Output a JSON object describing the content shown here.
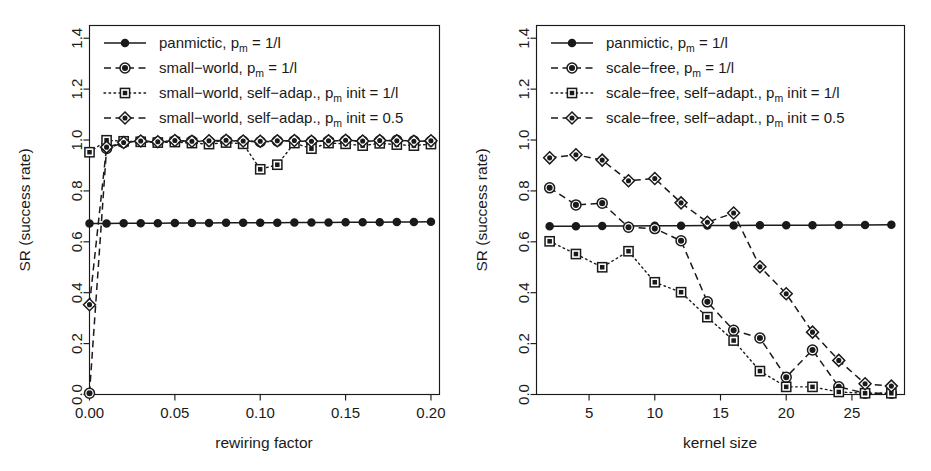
{
  "figure": {
    "panels": [
      "left",
      "right"
    ],
    "background": "#ffffff",
    "ink": "#1a1a1a"
  },
  "chart_data": [
    {
      "panel": "left",
      "type": "line",
      "title": "",
      "xlabel": "rewiring factor",
      "ylabel": "SR (success rate)",
      "xlim": [
        0.0,
        0.205
      ],
      "ylim": [
        0.0,
        1.45
      ],
      "xticks": [
        0.0,
        0.05,
        0.1,
        0.15,
        0.2
      ],
      "xtick_labels": [
        "0.00",
        "0.05",
        "0.10",
        "0.15",
        "0.20"
      ],
      "yticks": [
        0.0,
        0.2,
        0.4,
        0.6,
        0.8,
        1.0,
        1.2,
        1.4
      ],
      "ytick_labels": [
        "0.0",
        "0.2",
        "0.4",
        "0.6",
        "0.8",
        "1.0",
        "1.2",
        "1.4"
      ],
      "grid": false,
      "legend_position": "top-left",
      "x": [
        0.0,
        0.01,
        0.02,
        0.03,
        0.04,
        0.05,
        0.06,
        0.07,
        0.08,
        0.09,
        0.1,
        0.11,
        0.12,
        0.13,
        0.14,
        0.15,
        0.16,
        0.17,
        0.18,
        0.19,
        0.2
      ],
      "series": [
        {
          "name": "panmictic, pm = 1/l",
          "marker": "filled-circle",
          "line": "solid",
          "values": [
            0.672,
            0.672,
            0.673,
            0.673,
            0.673,
            0.674,
            0.674,
            0.674,
            0.675,
            0.675,
            0.675,
            0.675,
            0.676,
            0.676,
            0.676,
            0.677,
            0.677,
            0.677,
            0.678,
            0.678,
            0.679
          ]
        },
        {
          "name": "small-world, pm = 1/l",
          "marker": "dotted-circle",
          "line": "dashed",
          "values": [
            0.005,
            0.967,
            0.99,
            0.995,
            0.992,
            0.997,
            0.996,
            0.993,
            0.998,
            0.995,
            0.993,
            0.996,
            0.997,
            0.994,
            0.996,
            0.998,
            0.995,
            0.997,
            0.999,
            0.996,
            0.995
          ]
        },
        {
          "name": "small-world, self-adap., pm init = 1/l",
          "marker": "open-square",
          "line": "dotted",
          "values": [
            0.952,
            0.999,
            0.995,
            0.993,
            0.99,
            0.992,
            0.988,
            0.984,
            0.99,
            0.985,
            0.885,
            0.903,
            0.988,
            0.966,
            0.988,
            0.985,
            0.978,
            0.987,
            0.982,
            0.978,
            0.984
          ]
        },
        {
          "name": "small-world, self-adap., pm init = 0.5",
          "marker": "open-diamond",
          "line": "dashdot",
          "values": [
            0.353,
            0.972,
            0.99,
            0.996,
            0.993,
            0.998,
            0.995,
            0.997,
            0.999,
            0.996,
            0.995,
            0.997,
            0.998,
            0.995,
            0.997,
            0.999,
            0.996,
            0.998,
            0.997,
            0.995,
            0.997
          ]
        }
      ]
    },
    {
      "panel": "right",
      "type": "line",
      "title": "",
      "xlabel": "kernel size",
      "ylabel": "SR (success rate)",
      "xlim": [
        1.0,
        29.0
      ],
      "ylim": [
        0.0,
        1.45
      ],
      "xticks": [
        5,
        10,
        15,
        20,
        25
      ],
      "xtick_labels": [
        "5",
        "10",
        "15",
        "20",
        "25"
      ],
      "yticks": [
        0.0,
        0.2,
        0.4,
        0.6,
        0.8,
        1.0,
        1.2,
        1.4
      ],
      "ytick_labels": [
        "0.0",
        "0.2",
        "0.4",
        "0.6",
        "0.8",
        "1.0",
        "1.2",
        "1.4"
      ],
      "grid": false,
      "legend_position": "top-left",
      "x": [
        2,
        4,
        6,
        8,
        10,
        12,
        14,
        16,
        18,
        20,
        22,
        24,
        26,
        28
      ],
      "series": [
        {
          "name": "panmictic, pm = 1/l",
          "marker": "filled-circle",
          "line": "solid",
          "values": [
            0.661,
            0.661,
            0.662,
            0.662,
            0.663,
            0.663,
            0.664,
            0.664,
            0.665,
            0.665,
            0.665,
            0.666,
            0.666,
            0.667
          ]
        },
        {
          "name": "scale-free, pm = 1/l",
          "marker": "dotted-circle",
          "line": "dashed",
          "values": [
            0.812,
            0.745,
            0.752,
            0.657,
            0.652,
            0.604,
            0.364,
            0.252,
            0.222,
            0.068,
            0.175,
            0.03,
            0.005,
            0.005
          ]
        },
        {
          "name": "scale-free, self-adapt., pm init = 1/l",
          "marker": "open-square",
          "line": "dotted",
          "values": [
            0.602,
            0.552,
            0.5,
            0.563,
            0.441,
            0.402,
            0.304,
            0.212,
            0.092,
            0.03,
            0.03,
            0.01,
            0.005,
            0.005
          ]
        },
        {
          "name": "scale-free, self-adapt., pm init = 0.5",
          "marker": "open-diamond",
          "line": "dashdot",
          "values": [
            0.93,
            0.942,
            0.921,
            0.84,
            0.849,
            0.753,
            0.677,
            0.713,
            0.502,
            0.396,
            0.245,
            0.134,
            0.042,
            0.033
          ]
        }
      ]
    }
  ],
  "panel_left": {
    "axis": {
      "ylabel": "SR (success rate)",
      "xlabel": "rewiring factor",
      "xtick_labels": [
        "0.00",
        "0.05",
        "0.10",
        "0.15",
        "0.20"
      ],
      "ytick_labels": [
        "0.0",
        "0.2",
        "0.4",
        "0.6",
        "0.8",
        "1.0",
        "1.2",
        "1.4"
      ]
    },
    "legend": [
      {
        "main": "panmictic, p",
        "sub": "m",
        "tail": " = 1/l",
        "marker": "filled-circle",
        "line": "solid"
      },
      {
        "main": "small−world, p",
        "sub": "m",
        "tail": " = 1/l",
        "marker": "dotted-circle",
        "line": "dashed"
      },
      {
        "main": "small−world, self−adap., p",
        "sub": "m",
        "tail": " init = 1/l",
        "marker": "open-square",
        "line": "dotted"
      },
      {
        "main": "small−world, self−adap., p",
        "sub": "m",
        "tail": " init = 0.5",
        "marker": "open-diamond",
        "line": "dashdot"
      }
    ]
  },
  "panel_right": {
    "axis": {
      "ylabel": "SR (success rate)",
      "xlabel": "kernel size",
      "xtick_labels": [
        "5",
        "10",
        "15",
        "20",
        "25"
      ],
      "ytick_labels": [
        "0.0",
        "0.2",
        "0.4",
        "0.6",
        "0.8",
        "1.0",
        "1.2",
        "1.4"
      ]
    },
    "legend": [
      {
        "main": "panmictic, p",
        "sub": "m",
        "tail": " = 1/l",
        "marker": "filled-circle",
        "line": "solid"
      },
      {
        "main": "scale−free, p",
        "sub": "m",
        "tail": " = 1/l",
        "marker": "dotted-circle",
        "line": "dashed"
      },
      {
        "main": "scale−free, self−adapt., p",
        "sub": "m",
        "tail": " init = 1/l",
        "marker": "open-square",
        "line": "dotted"
      },
      {
        "main": "scale−free, self−adapt., p",
        "sub": "m",
        "tail": " init = 0.5",
        "marker": "open-diamond",
        "line": "dashdot"
      }
    ]
  }
}
